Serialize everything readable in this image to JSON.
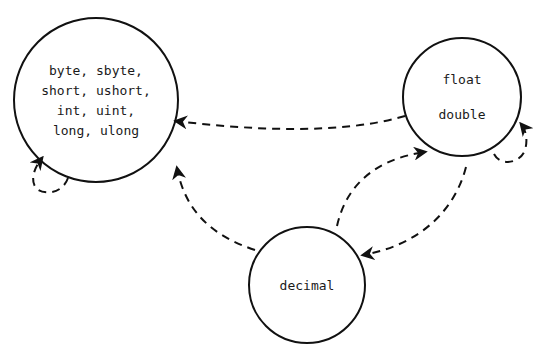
{
  "diagram": {
    "type": "numeric-conversion-graph",
    "nodes": [
      {
        "id": "integral",
        "lines": [
          "byte, sbyte,",
          "short, ushort,",
          "int, uint,",
          "long, ulong"
        ]
      },
      {
        "id": "floating",
        "lines": [
          "float",
          "double"
        ]
      },
      {
        "id": "decimal",
        "lines": [
          "decimal"
        ]
      }
    ],
    "edges": [
      {
        "from": "integral",
        "to": "integral",
        "style": "dashed"
      },
      {
        "from": "floating",
        "to": "floating",
        "style": "dashed"
      },
      {
        "from": "floating",
        "to": "integral",
        "style": "dashed"
      },
      {
        "from": "decimal",
        "to": "integral",
        "style": "dashed"
      },
      {
        "from": "decimal",
        "to": "floating",
        "style": "dashed"
      },
      {
        "from": "floating",
        "to": "decimal",
        "style": "dashed"
      }
    ],
    "colors": {
      "stroke": "#111111",
      "background": "#ffffff"
    }
  }
}
